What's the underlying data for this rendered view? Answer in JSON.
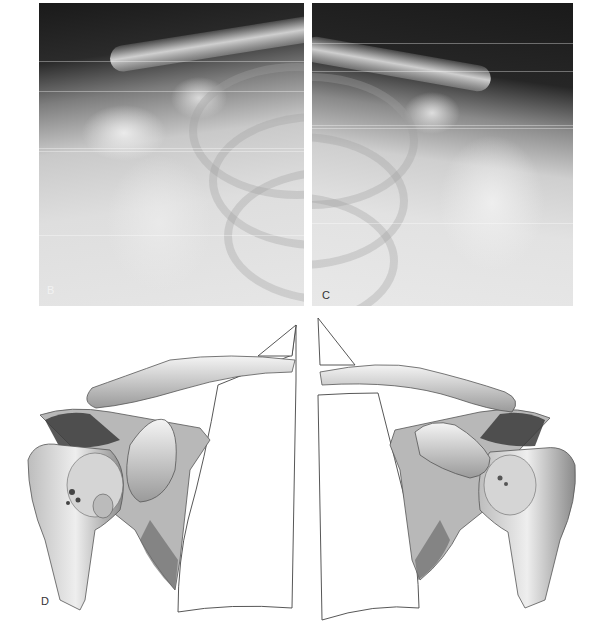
{
  "figure": {
    "panels": [
      {
        "id": "B",
        "label": "B",
        "type": "radiograph",
        "side": "right shoulder (viewer's left)"
      },
      {
        "id": "C",
        "label": "C",
        "type": "radiograph",
        "side": "left shoulder (viewer's right)"
      },
      {
        "id": "D",
        "label": "D",
        "type": "anatomical illustration",
        "description": "bilateral shoulder girdle with clavicles, scapulae, humeral heads and lung outlines"
      }
    ],
    "colors": {
      "background": "#ffffff",
      "xray_dark": "#1a1a1a",
      "xray_light": "#e6e6e6",
      "ink": "#3a3a3a"
    }
  }
}
